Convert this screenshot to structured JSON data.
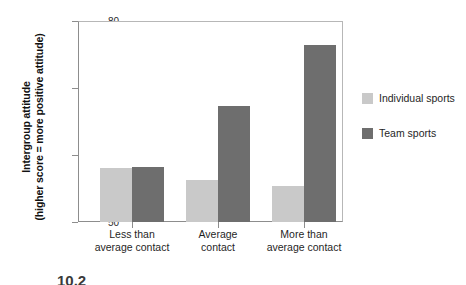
{
  "chart_data": {
    "type": "bar",
    "title": "",
    "subtitle": "",
    "xlabel": "",
    "ylabel": "Intergroup attitude (higher score = more positive attitude)",
    "ylabel_lines": [
      "Intergroup attitude",
      "(higher score = more positive attitude)"
    ],
    "categories": [
      "Less than average contact",
      "Average contact",
      "More than average contact"
    ],
    "category_lines": [
      [
        "Less than",
        "average contact"
      ],
      [
        "Average",
        "contact"
      ],
      [
        "More than",
        "average contact"
      ]
    ],
    "series": [
      {
        "name": "Individual sports",
        "color": "#c9c9c9",
        "values": [
          58.1,
          56.3,
          55.4
        ]
      },
      {
        "name": "Team sports",
        "color": "#6e6e6e",
        "values": [
          58.2,
          67.3,
          76.4
        ]
      }
    ],
    "ylim": [
      50,
      80
    ],
    "yticks": [
      50,
      60,
      70,
      80
    ],
    "ytick_labels": [
      "50",
      "60",
      "70",
      "80"
    ],
    "grid": false,
    "legend_position": "right"
  },
  "legend": {
    "items": [
      {
        "label": "Individual sports",
        "color": "#c9c9c9"
      },
      {
        "label": "Team sports",
        "color": "#6e6e6e"
      }
    ]
  },
  "caption": {
    "number": "10.2"
  },
  "colors": {
    "individual_sports": "#c9c9c9",
    "team_sports": "#6e6e6e",
    "axis": "#8d8d8d",
    "frame": "#b7b7b7",
    "text": "#1f1f1f",
    "background": "#ffffff"
  }
}
